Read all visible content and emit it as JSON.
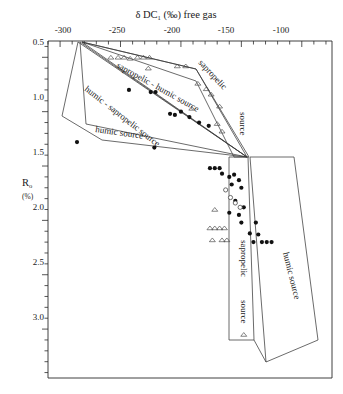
{
  "figure": {
    "title_prefix": "δ",
    "title_main": "DC",
    "title_sub": "1",
    "title_rest": "(‰) free gas",
    "x_axis_label": "δ DC1 (‰) free gas",
    "y_axis_label": "R",
    "y_axis_sub": "o",
    "y_axis_units": "(%)"
  },
  "chart_data": {
    "type": "scatter",
    "title": "δ DC1 (‰) free gas",
    "xlabel": "δ DC1 (‰) free gas",
    "ylabel": "Ro (%)",
    "xlim": [
      -310,
      -75
    ],
    "ylim": [
      0.35,
      3.45
    ],
    "x_ticks": [
      -300,
      -250,
      -200,
      -150,
      -100
    ],
    "x_tick_labels": [
      "-300",
      "-250",
      "-200",
      "-150",
      "-100"
    ],
    "x_minor_step": 10,
    "y_ticks": [
      0.5,
      1.0,
      1.5,
      2.0,
      2.5,
      3.0
    ],
    "y_tick_labels": [
      "0.5",
      "1.0",
      "1.5",
      "2.0",
      "2.5",
      "3.0"
    ],
    "y_minor_step": 0.1,
    "x_axis_position": "top",
    "y_axis_direction": "inverted",
    "grid": false,
    "legend": false,
    "series": [
      {
        "name": "filled circles",
        "marker": "filled-circle",
        "points": [
          [
            -243,
            0.8
          ],
          [
            -225,
            0.82
          ],
          [
            -221,
            0.82
          ],
          [
            -209,
            1.02
          ],
          [
            -205,
            1.03
          ],
          [
            -200,
            1.0
          ],
          [
            -193,
            1.05
          ],
          [
            -185,
            1.1
          ],
          [
            -177,
            1.13
          ],
          [
            -286,
            1.28
          ],
          [
            -222,
            1.33
          ],
          [
            -176,
            1.52
          ],
          [
            -172,
            1.52
          ],
          [
            -168,
            1.52
          ],
          [
            -166,
            1.57
          ],
          [
            -160,
            1.6
          ],
          [
            -156,
            1.58
          ],
          [
            -152,
            1.63
          ],
          [
            -158,
            1.67
          ],
          [
            -150,
            1.7
          ],
          [
            -155,
            1.82
          ],
          [
            -148,
            1.88
          ],
          [
            -160,
            1.93
          ],
          [
            -152,
            1.95
          ],
          [
            -150,
            2.02
          ],
          [
            -138,
            2.02
          ],
          [
            -143,
            2.12
          ],
          [
            -136,
            2.13
          ],
          [
            -140,
            2.2
          ],
          [
            -133,
            2.2
          ],
          [
            -129,
            2.2
          ],
          [
            -125,
            2.2
          ]
        ]
      },
      {
        "name": "open circles",
        "marker": "open-circle",
        "points": [
          [
            -163,
            1.72
          ],
          [
            -159,
            1.79
          ],
          [
            -155,
            1.84
          ],
          [
            -151,
            1.88
          ]
        ]
      },
      {
        "name": "open triangles",
        "marker": "open-triangle",
        "points": [
          [
            -258,
            0.5
          ],
          [
            -252,
            0.5
          ],
          [
            -247,
            0.5
          ],
          [
            -242,
            0.51
          ],
          [
            -236,
            0.5
          ],
          [
            -231,
            0.5
          ],
          [
            -226,
            0.5
          ],
          [
            -227,
            0.6
          ],
          [
            -203,
            0.58
          ],
          [
            -196,
            0.58
          ],
          [
            -186,
            0.74
          ],
          [
            -179,
            0.79
          ],
          [
            -175,
            0.84
          ],
          [
            -168,
            0.95
          ],
          [
            -191,
            0.97
          ],
          [
            -170,
            1.11
          ],
          [
            -166,
            1.18
          ],
          [
            -172,
            1.9
          ],
          [
            -176,
            2.07
          ],
          [
            -172,
            2.07
          ],
          [
            -168,
            2.07
          ],
          [
            -164,
            2.07
          ],
          [
            -174,
            2.18
          ],
          [
            -166,
            2.18
          ],
          [
            -162,
            2.18
          ],
          [
            -148,
            3.05
          ]
        ]
      }
    ]
  },
  "regions": [
    {
      "id": "humic-source-upper",
      "label": "humic source"
    },
    {
      "id": "humic-sapropelic",
      "label": "humic - sapropelic source"
    },
    {
      "id": "sapropelic-humic",
      "label": "sapropelic - humic source"
    },
    {
      "id": "sapropelic-upper",
      "label": "sapropelic"
    },
    {
      "id": "sapropelic-source-1",
      "label": "source"
    },
    {
      "id": "sapropelic-source-2",
      "label": "sapropelic"
    },
    {
      "id": "sapropelic-source-3",
      "label": "source"
    },
    {
      "id": "humic-source-lower",
      "label": "humic source"
    }
  ],
  "colors": {
    "axis": "#2b2b2b",
    "polygon": "#3a3a3a",
    "marker_fill": "#111111",
    "marker_open": "#ffffff",
    "background": "#ffffff"
  }
}
